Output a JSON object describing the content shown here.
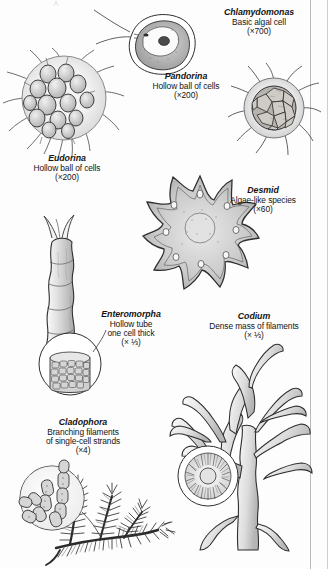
{
  "plate": {
    "title": "Green algae specimen plate",
    "background_color": "#fdfdfd",
    "ink_color": "#1a1a1a",
    "rule_color": "#b9b9b9"
  },
  "specimens": [
    {
      "id": "chlamydomonas",
      "name": "Chlamydomonas",
      "description": [
        "Basic algal cell"
      ],
      "magnification": "(×700)",
      "figure": "single-ovoid-cell-with-two-flagella"
    },
    {
      "id": "pandorina",
      "name": "Pandorina",
      "description": [
        "Hollow ball of cells"
      ],
      "magnification": "(×200)",
      "figure": "small-colony-sphere-with-flagella"
    },
    {
      "id": "eudorina",
      "name": "Eudorina",
      "description": [
        "Hollow ball of cells"
      ],
      "magnification": "(×200)",
      "figure": "large-colony-sphere-with-flagella"
    },
    {
      "id": "desmid",
      "name": "Desmid",
      "description": [
        "Algae-like species"
      ],
      "magnification": "(×60)",
      "figure": "radial-star-lobed-cell"
    },
    {
      "id": "enteromorpha",
      "name": "Enteromorpha",
      "description": [
        "Hollow tube",
        "one cell thick"
      ],
      "magnification": "(× ⅓)",
      "figure": "hollow-tube-frond-with-cell-inset"
    },
    {
      "id": "codium",
      "name": "Codium",
      "description": [
        "Dense mass of filaments"
      ],
      "magnification": "(× ⅓)",
      "figure": "branching-forked-thallus-with-inset"
    },
    {
      "id": "cladophora",
      "name": "Cladophora",
      "description": [
        "Branching filaments",
        "of single-cell strands"
      ],
      "magnification": "(×4)",
      "figure": "feathery-branched-tuft-with-cell-inset"
    }
  ]
}
